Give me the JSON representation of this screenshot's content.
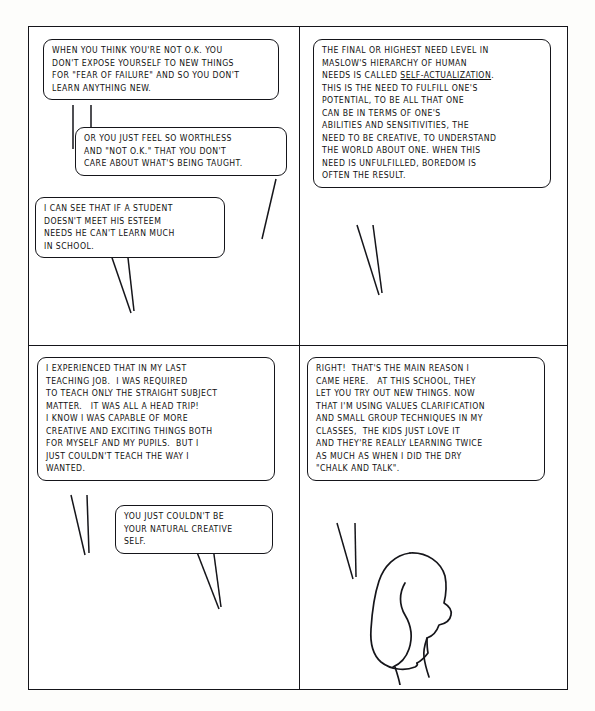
{
  "page": {
    "ink_color": "#15151a",
    "paper_color": "#fdfdfb",
    "panel_count": 4
  },
  "panels": [
    {
      "id": "panel-1",
      "position": "top-left",
      "balloons": [
        {
          "id": "p1-b1",
          "speaker": "off-panel-left",
          "text": "WHEN YOU THINK YOU'RE NOT O.K. YOU\nDON'T EXPOSE YOURSELF TO NEW THINGS\nFOR \"FEAR OF FAILURE\" AND SO YOU DON'T\nLEARN ANYTHING NEW."
        },
        {
          "id": "p1-b2",
          "speaker": "off-panel-left",
          "text": "OR YOU JUST FEEL SO WORTHLESS\nAND \"NOT O.K.\" THAT YOU DON'T\nCARE ABOUT WHAT'S BEING TAUGHT."
        },
        {
          "id": "p1-b3",
          "speaker": "off-panel-left",
          "text": "I CAN SEE THAT IF A STUDENT\nDOESN'T MEET HIS ESTEEM\nNEEDS HE CAN'T LEARN MUCH\nIN SCHOOL."
        }
      ]
    },
    {
      "id": "panel-2",
      "position": "top-right",
      "balloons": [
        {
          "id": "p2-b1",
          "speaker": "off-panel-left",
          "text_before_underline": "THE FINAL OR HIGHEST NEED LEVEL IN\nMASLOW'S HIERARCHY OF HUMAN\nNEEDS IS CALLED ",
          "underlined_term": "SELF-ACTUALIZATION",
          "text_after_underline": ".\nTHIS IS THE NEED TO FULFILL ONE'S\nPOTENTIAL, TO BE ALL THAT ONE\nCAN BE IN TERMS OF ONE'S\nABILITIES AND SENSITIVITIES, THE\nNEED TO BE CREATIVE, TO UNDERSTAND\nTHE WORLD ABOUT ONE. WHEN THIS\nNEED IS UNFULFILLED, BOREDOM IS\nOFTEN THE RESULT."
        }
      ]
    },
    {
      "id": "panel-3",
      "position": "bottom-left",
      "balloons": [
        {
          "id": "p3-b1",
          "speaker": "off-panel-left",
          "text": "I EXPERIENCED THAT IN MY LAST\nTEACHING JOB.  I WAS REQUIRED\nTO TEACH ONLY THE STRAIGHT SUBJECT\nMATTER.   IT WAS ALL A HEAD TRIP!\nI KNOW I WAS CAPABLE OF MORE\nCREATIVE AND EXCITING THINGS BOTH\nFOR MYSELF AND MY PUPILS.  BUT I\nJUST COULDN'T TEACH THE WAY I\nWANTED."
        },
        {
          "id": "p3-b2",
          "speaker": "off-panel-left",
          "text": "YOU JUST COULDN'T BE\nYOUR NATURAL CREATIVE\nSELF."
        }
      ]
    },
    {
      "id": "panel-4",
      "position": "bottom-right",
      "balloons": [
        {
          "id": "p4-b1",
          "speaker": "woman-figure",
          "text": "RIGHT!  THAT'S THE MAIN REASON I\nCAME HERE.   AT THIS SCHOOL, THEY\nLET YOU TRY OUT NEW THINGS. NOW\nTHAT I'M USING VALUES CLARIFICATION\nAND SMALL GROUP TECHNIQUES IN MY\nCLASSES,  THE KIDS JUST LOVE IT\nAND THEY'RE REALLY LEARNING TWICE\nAS MUCH AS WHEN I DID THE DRY\n\"CHALK AND TALK\"."
        }
      ],
      "figure": {
        "name": "woman-profile-silhouette",
        "description": "Line-drawn profile of a woman with long hair facing right"
      }
    }
  ]
}
